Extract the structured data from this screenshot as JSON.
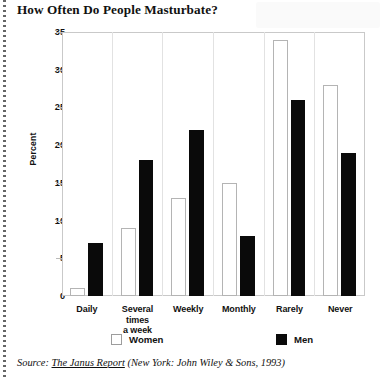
{
  "title": "How Often Do People Masturbate?",
  "source": {
    "prefix": "Source: ",
    "work": "The Janus Report",
    "citation": " (New York: John Wiley & Sons, 1993)"
  },
  "legend": {
    "women_label": "Women",
    "men_label": "Men"
  },
  "chart_data": {
    "type": "bar",
    "title": "How Often Do People Masturbate?",
    "xlabel": "",
    "ylabel": "Percent",
    "ylim": [
      0,
      35
    ],
    "yticks": [
      "0",
      "5",
      "10",
      "15",
      "20",
      "25",
      "30",
      "35"
    ],
    "grid": false,
    "legend_position": "bottom",
    "categories": [
      "Daily",
      "Several times a week",
      "Weekly",
      "Monthly",
      "Rarely",
      "Never"
    ],
    "series": [
      {
        "name": "Women",
        "values": [
          1,
          9,
          13,
          15,
          34,
          28
        ]
      },
      {
        "name": "Men",
        "values": [
          7,
          18,
          22,
          8,
          26,
          19
        ]
      }
    ]
  }
}
